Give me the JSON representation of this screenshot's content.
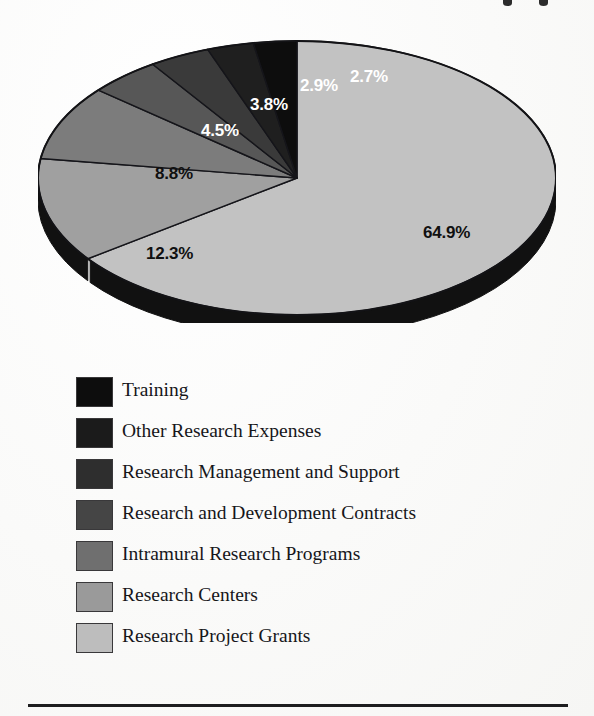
{
  "figure": {
    "kind": "3d-pie-chart",
    "background_color": "#fbfbfa"
  },
  "chart_data": {
    "type": "pie",
    "title": "",
    "xlabel": "",
    "ylabel": "",
    "legend_position": "below",
    "grid": false,
    "units": "percent",
    "categories": [
      "Research Project Grants",
      "Research Centers",
      "Intramural Research Programs",
      "Research and Development Contracts",
      "Research Management and Support",
      "Other Research Expenses",
      "Training"
    ],
    "values": [
      64.9,
      12.3,
      8.8,
      4.5,
      3.8,
      2.9,
      2.7
    ],
    "labels": [
      "64.9%",
      "12.3%",
      "8.8%",
      "4.5%",
      "3.8%",
      "2.9%",
      "2.7%"
    ],
    "colors": [
      "#c2c2c2",
      "#a0a0a0",
      "#7c7c7c",
      "#575757",
      "#3a3a3a",
      "#1f1f1f",
      "#0d0d0d"
    ]
  },
  "pie": {
    "slices": [
      {
        "label": "64.9%",
        "value": 64.9,
        "color": "#c2c2c2",
        "side_color": "#111111",
        "text_color": "dark",
        "name": "research-project-grants"
      },
      {
        "label": "12.3%",
        "value": 12.3,
        "color": "#a0a0a0",
        "side_color": "#111111",
        "text_color": "dark",
        "name": "research-centers"
      },
      {
        "label": "8.8%",
        "value": 8.8,
        "color": "#7c7c7c",
        "side_color": "#111111",
        "text_color": "dark",
        "name": "intramural-research-programs"
      },
      {
        "label": "4.5%",
        "value": 4.5,
        "color": "#575757",
        "side_color": "#111111",
        "text_color": "light",
        "name": "research-and-development-contracts"
      },
      {
        "label": "3.8%",
        "value": 3.8,
        "color": "#3a3a3a",
        "side_color": "#111111",
        "text_color": "light",
        "name": "research-management-and-support"
      },
      {
        "label": "2.9%",
        "value": 2.9,
        "color": "#1f1f1f",
        "side_color": "#111111",
        "text_color": "light",
        "name": "other-research-expenses"
      },
      {
        "label": "2.7%",
        "value": 2.7,
        "color": "#0d0d0d",
        "side_color": "#111111",
        "text_color": "light",
        "name": "training"
      }
    ],
    "label_positions": [
      {
        "label": "64.9%",
        "x": 385,
        "y": 185,
        "size": 17,
        "tone": "dark"
      },
      {
        "label": "12.3%",
        "x": 108,
        "y": 206,
        "size": 17,
        "tone": "dark"
      },
      {
        "label": "8.8%",
        "x": 117,
        "y": 126,
        "size": 17,
        "tone": "dark"
      },
      {
        "label": "4.5%",
        "x": 163,
        "y": 83,
        "size": 17,
        "tone": "light"
      },
      {
        "label": "3.8%",
        "x": 212,
        "y": 57,
        "size": 17,
        "tone": "light"
      },
      {
        "label": "2.9%",
        "x": 262,
        "y": 38,
        "size": 17,
        "tone": "light"
      },
      {
        "label": "2.7%",
        "x": 312,
        "y": 29,
        "size": 17,
        "tone": "light"
      }
    ]
  },
  "legend": {
    "items": [
      {
        "label": "Training",
        "color": "#0d0d0d"
      },
      {
        "label": "Other Research Expenses",
        "color": "#1b1b1b"
      },
      {
        "label": "Research Management and Support",
        "color": "#2e2e2e"
      },
      {
        "label": "Research and Development Contracts",
        "color": "#454545"
      },
      {
        "label": "Intramural Research Programs",
        "color": "#6f6f6f"
      },
      {
        "label": "Research Centers",
        "color": "#9a9a9a"
      },
      {
        "label": "Research Project Grants",
        "color": "#bdbdbd"
      }
    ]
  }
}
